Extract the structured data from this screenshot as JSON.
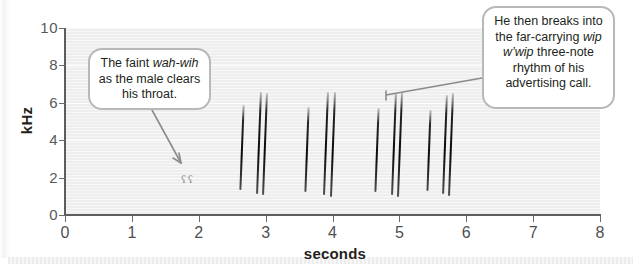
{
  "chart_data": {
    "type": "scatter",
    "title": "",
    "xlabel": "seconds",
    "ylabel": "kHz",
    "xlim": [
      0,
      8
    ],
    "ylim": [
      0,
      10
    ],
    "xticks": [
      "0",
      "1",
      "2",
      "3",
      "4",
      "5",
      "6",
      "7",
      "8"
    ],
    "yticks": [
      "0",
      "2",
      "4",
      "6",
      "8",
      "10"
    ],
    "grid": true,
    "plot_background": "#eeeeee",
    "trace_color": "#121212",
    "faint_marks": [
      {
        "label": "wah",
        "t": 1.74,
        "khz": 1.9
      },
      {
        "label": "wih",
        "t": 1.84,
        "khz": 1.9
      }
    ],
    "note_groups": [
      {
        "name": "group-1",
        "notes": [
          {
            "t": 2.63,
            "khz_top": 5.9,
            "khz_bottom": 1.35
          },
          {
            "t": 2.88,
            "khz_top": 6.6,
            "khz_bottom": 1.15
          },
          {
            "t": 2.97,
            "khz_top": 6.5,
            "khz_bottom": 1.05
          }
        ]
      },
      {
        "name": "group-2",
        "notes": [
          {
            "t": 3.6,
            "khz_top": 5.8,
            "khz_bottom": 1.25
          },
          {
            "t": 3.89,
            "khz_top": 6.6,
            "khz_bottom": 1.1
          },
          {
            "t": 3.99,
            "khz_top": 6.6,
            "khz_bottom": 1.0
          }
        ]
      },
      {
        "name": "group-3",
        "notes": [
          {
            "t": 4.65,
            "khz_top": 5.7,
            "khz_bottom": 1.2
          },
          {
            "t": 4.9,
            "khz_top": 6.5,
            "khz_bottom": 1.05
          },
          {
            "t": 4.99,
            "khz_top": 6.6,
            "khz_bottom": 1.0
          }
        ]
      },
      {
        "name": "group-4",
        "notes": [
          {
            "t": 5.43,
            "khz_top": 5.6,
            "khz_bottom": 1.25
          },
          {
            "t": 5.66,
            "khz_top": 6.4,
            "khz_bottom": 1.1
          },
          {
            "t": 5.76,
            "khz_top": 6.5,
            "khz_bottom": 1.0
          }
        ]
      }
    ]
  },
  "axes": {
    "x_title": "seconds",
    "y_title": "kHz",
    "x_ticks": [
      "0",
      "1",
      "2",
      "3",
      "4",
      "5",
      "6",
      "7",
      "8"
    ],
    "y_ticks": [
      "0",
      "2",
      "4",
      "6",
      "8",
      "10"
    ]
  },
  "callouts": {
    "left": {
      "line1_pre": "The faint ",
      "line1_em": "wah-wih",
      "line2": "as the male clears",
      "line3": "his throat."
    },
    "right": {
      "line1": "He then breaks into",
      "line2_pre": "the far-carrying ",
      "line2_em": "wip",
      "line3_em": "w’wip",
      "line3_post": " three-note",
      "line4": "rhythm of his",
      "line5": "advertising call."
    }
  }
}
